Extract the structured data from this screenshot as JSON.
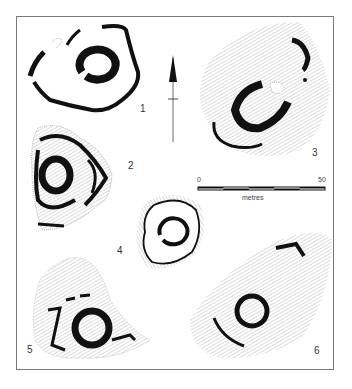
{
  "figure": {
    "type": "archaeological site plans",
    "frame_color": "#7a7a7a",
    "ink_color": "#111111",
    "hachure_color": "#9a9a9a"
  },
  "plans": [
    {
      "id": 1,
      "label": "1"
    },
    {
      "id": 2,
      "label": "2"
    },
    {
      "id": 3,
      "label": "3"
    },
    {
      "id": 4,
      "label": "4"
    },
    {
      "id": 5,
      "label": "5"
    },
    {
      "id": 6,
      "label": "6"
    }
  ],
  "north_arrow": {
    "icon": "north-arrow-icon"
  },
  "scale_bar": {
    "start_label": "0",
    "end_label": "50",
    "unit_label": "metres",
    "segments": 5
  }
}
